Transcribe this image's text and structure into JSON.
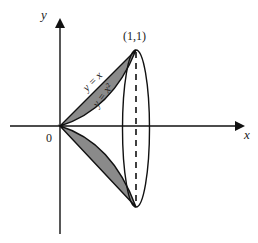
{
  "diagram": {
    "type": "solid-of-revolution",
    "labels": {
      "y_axis": "y",
      "x_axis": "x",
      "origin": "0",
      "point": "(1,1)",
      "line_curve": "y = x",
      "parabola_curve": "y = x²"
    },
    "colors": {
      "shaded_region": "#8a8a8a",
      "stroke": "#111111",
      "background": "#ffffff"
    }
  }
}
